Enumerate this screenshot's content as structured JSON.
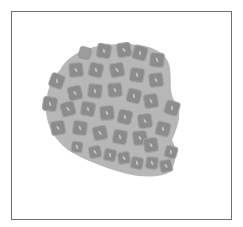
{
  "image": {
    "subject": "cluster of polygonal cells on an oval tissue region",
    "colors": {
      "background": "#ffffff",
      "frame": "#6e6e6e",
      "tissue": "#b7b7b7",
      "cell": "#8c8c8c",
      "cell_edge": "#a4a4a4",
      "nucleus": "#c9c9c9",
      "dotted_cell": "#7a7a7a"
    },
    "tissue_outline": "M60,70 C70,52 90,45 120,44 C150,43 168,52 170,68 C172,85 168,95 178,105 C182,118 176,130 172,140 C178,150 176,165 170,172 C160,178 140,178 120,172 C100,166 80,158 68,150 C55,140 45,125 46,105 C47,88 52,78 60,70 Z",
    "dotted_cell": {
      "x": 85,
      "y": 53,
      "r": 6
    },
    "cells": [
      {
        "x": 104,
        "y": 51,
        "r": 7,
        "rot": 10
      },
      {
        "x": 124,
        "y": 50,
        "r": 7,
        "rot": -8
      },
      {
        "x": 140,
        "y": 53,
        "r": 7,
        "rot": 15
      },
      {
        "x": 157,
        "y": 60,
        "r": 7,
        "rot": 5
      },
      {
        "x": 76,
        "y": 70,
        "r": 7,
        "rot": -5
      },
      {
        "x": 96,
        "y": 70,
        "r": 7,
        "rot": 12
      },
      {
        "x": 117,
        "y": 70,
        "r": 7,
        "rot": -10
      },
      {
        "x": 137,
        "y": 75,
        "r": 7,
        "rot": 8
      },
      {
        "x": 156,
        "y": 80,
        "r": 7,
        "rot": -6
      },
      {
        "x": 57,
        "y": 81,
        "r": 7,
        "rot": 20
      },
      {
        "x": 75,
        "y": 93,
        "r": 7,
        "rot": -12
      },
      {
        "x": 95,
        "y": 91,
        "r": 7,
        "rot": 6
      },
      {
        "x": 115,
        "y": 90,
        "r": 7,
        "rot": -4
      },
      {
        "x": 134,
        "y": 96,
        "r": 7,
        "rot": 14
      },
      {
        "x": 151,
        "y": 101,
        "r": 7,
        "rot": -9
      },
      {
        "x": 50,
        "y": 104,
        "r": 7,
        "rot": 8
      },
      {
        "x": 68,
        "y": 109,
        "r": 7,
        "rot": -15
      },
      {
        "x": 88,
        "y": 109,
        "r": 7,
        "rot": 10
      },
      {
        "x": 107,
        "y": 113,
        "r": 7,
        "rot": -5
      },
      {
        "x": 125,
        "y": 117,
        "r": 7,
        "rot": 12
      },
      {
        "x": 145,
        "y": 121,
        "r": 7,
        "rot": -8
      },
      {
        "x": 172,
        "y": 108,
        "r": 7,
        "rot": 18
      },
      {
        "x": 58,
        "y": 128,
        "r": 7,
        "rot": -10
      },
      {
        "x": 80,
        "y": 128,
        "r": 7,
        "rot": 6
      },
      {
        "x": 100,
        "y": 133,
        "r": 7,
        "rot": -12
      },
      {
        "x": 120,
        "y": 137,
        "r": 7,
        "rot": 9
      },
      {
        "x": 140,
        "y": 138,
        "r": 7,
        "rot": -5
      },
      {
        "x": 163,
        "y": 129,
        "r": 7,
        "rot": 14
      },
      {
        "x": 77,
        "y": 147,
        "r": 5.5,
        "rot": 8
      },
      {
        "x": 95,
        "y": 152,
        "r": 6,
        "rot": -10
      },
      {
        "x": 110,
        "y": 155,
        "r": 6,
        "rot": 12
      },
      {
        "x": 124,
        "y": 158,
        "r": 6,
        "rot": -6
      },
      {
        "x": 137,
        "y": 163,
        "r": 6,
        "rot": 10
      },
      {
        "x": 151,
        "y": 145,
        "r": 7,
        "rot": -8
      },
      {
        "x": 152,
        "y": 163,
        "r": 6,
        "rot": 5
      },
      {
        "x": 166,
        "y": 166,
        "r": 6,
        "rot": -12
      },
      {
        "x": 171,
        "y": 152,
        "r": 6,
        "rot": 16
      }
    ]
  }
}
